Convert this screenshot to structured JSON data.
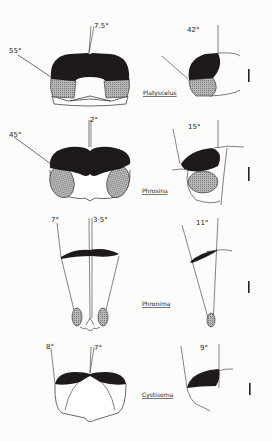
{
  "figure": {
    "type": "diagram",
    "colors": {
      "dorsal_eye": "#1e1a1a",
      "ventral_eye": "#a8a8a8",
      "outline": "#2a2a2a",
      "background": "#fcfcfa"
    },
    "rows": [
      {
        "species": "Platyscelus",
        "front_angles": {
          "lateral": "55°",
          "medial": "7.5°"
        },
        "side_angle": "42°"
      },
      {
        "species": "Phrosina",
        "front_angles": {
          "lateral": "45°",
          "medial": "2°"
        },
        "side_angle": "15°"
      },
      {
        "species": "Phronima",
        "front_angles": {
          "lateral": "7°",
          "medial": "3·5°"
        },
        "side_angle": "11°"
      },
      {
        "species": "Cystisoma",
        "front_angles": {
          "lateral": "8°",
          "medial": "7°"
        },
        "side_angle": "9°"
      }
    ],
    "legend": {
      "dorsal_eye": "black fill",
      "ventral_eye": "stippled fill",
      "scale_bar": "vertical bar at right of each row"
    }
  }
}
